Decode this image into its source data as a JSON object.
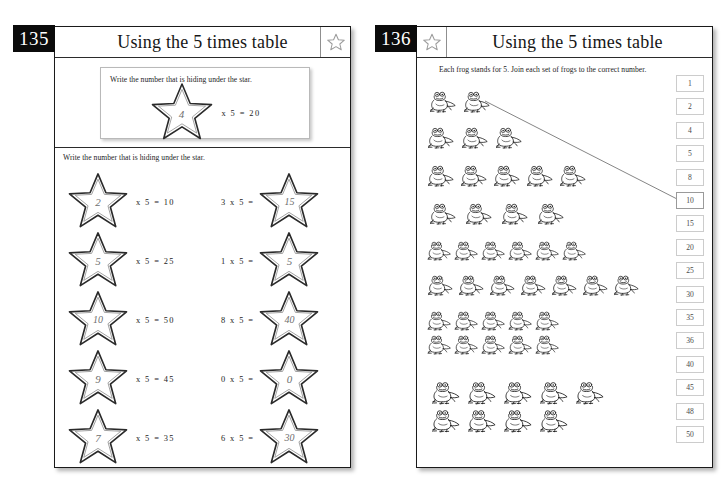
{
  "spread": {
    "background": "#ffffff",
    "ink": "#1d1d1d",
    "badge_bg": "#0b0b0b",
    "badge_fg": "#ffffff",
    "pencil": "#6e6e6e"
  },
  "left_page": {
    "page_number": "135",
    "title": "Using the 5 times table",
    "star_badge_icon": "star-outline-icon",
    "example": {
      "instruction": "Write the number that is hiding under the star.",
      "star_value": "4",
      "equation": "x  5  =  20"
    },
    "section_instruction": "Write the number that is hiding under the star.",
    "problems": [
      {
        "form": "star-first",
        "star_value": "2",
        "equation": "x  5  =  10",
        "column": "left",
        "row": 1
      },
      {
        "form": "star-last",
        "star_value": "15",
        "equation": "3  x  5  =",
        "column": "right",
        "row": 1
      },
      {
        "form": "star-first",
        "star_value": "5",
        "equation": "x  5  =  25",
        "column": "left",
        "row": 2
      },
      {
        "form": "star-last",
        "star_value": "5",
        "equation": "1  x  5  =",
        "column": "right",
        "row": 2
      },
      {
        "form": "star-first",
        "star_value": "10",
        "equation": "x  5  =  50",
        "column": "left",
        "row": 3
      },
      {
        "form": "star-last",
        "star_value": "40",
        "equation": "8  x  5  =",
        "column": "right",
        "row": 3
      },
      {
        "form": "star-first",
        "star_value": "9",
        "equation": "x  5  =  45",
        "column": "left",
        "row": 4
      },
      {
        "form": "star-last",
        "star_value": "0",
        "equation": "0  x  5  =",
        "column": "right",
        "row": 4
      },
      {
        "form": "star-first",
        "star_value": "7",
        "equation": "x  5  =  35",
        "column": "left",
        "row": 5
      },
      {
        "form": "star-last",
        "star_value": "30",
        "equation": "6  x  5  =",
        "column": "right",
        "row": 5
      }
    ]
  },
  "right_page": {
    "page_number": "136",
    "title": "Using the 5 times table",
    "star_badge_icon": "star-outline-icon",
    "instruction": "Each frog stands for 5. Join each set of frogs to the correct number.",
    "frog_icon": "frog-icon",
    "frog_groups": [
      {
        "count": 2,
        "lines": [
          2
        ],
        "answer": "10",
        "joined": true
      },
      {
        "count": 3,
        "lines": [
          3
        ],
        "answer": "15",
        "joined": false
      },
      {
        "count": 5,
        "lines": [
          5
        ],
        "answer": "25",
        "joined": false
      },
      {
        "count": 4,
        "lines": [
          4
        ],
        "answer": "20",
        "joined": false
      },
      {
        "count": 6,
        "lines": [
          6
        ],
        "answer": "30",
        "joined": false
      },
      {
        "count": 7,
        "lines": [
          7
        ],
        "answer": "35",
        "joined": false
      },
      {
        "count": 10,
        "lines": [
          5,
          5
        ],
        "answer": "50",
        "joined": false
      },
      {
        "count": 9,
        "lines": [
          5,
          4
        ],
        "answer": "45",
        "joined": false
      }
    ],
    "number_options": [
      "1",
      "2",
      "4",
      "5",
      "8",
      "10",
      "15",
      "20",
      "25",
      "30",
      "35",
      "36",
      "40",
      "45",
      "48",
      "50"
    ],
    "linked_number": "10"
  }
}
